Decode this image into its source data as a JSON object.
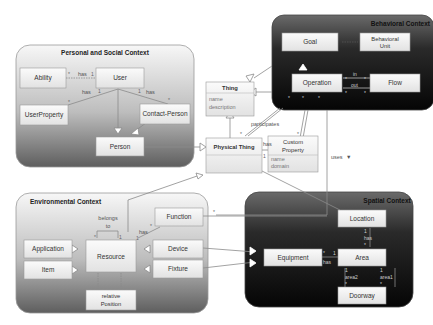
{
  "contexts": {
    "personal": {
      "title": "Personal and Social Context"
    },
    "behavioral": {
      "title": "Behavioral Context"
    },
    "environmental": {
      "title": "Environmental Context"
    },
    "spatial": {
      "title": "Spatial Context"
    }
  },
  "classes": {
    "ability": "Ability",
    "user": "User",
    "user_property": "UserProperty",
    "contact_person": "Contact-Person",
    "person": "Person",
    "thing": {
      "name": "Thing",
      "attrs": [
        "name",
        "description"
      ]
    },
    "physical_thing": "Physical Thing",
    "custom_property": {
      "name_line1": "Custom",
      "name_line2": "Property",
      "attrs": [
        "name",
        "domain"
      ]
    },
    "goal": "Goal",
    "behavioral_unit": {
      "line1": "Behavioral",
      "line2": "Unit"
    },
    "operation": "Operation",
    "flow": "Flow",
    "application": "Application",
    "item": "Item",
    "resource": "Resource",
    "function": "Function",
    "device": "Device",
    "fixture": "Fixture",
    "relative_position": {
      "line1": "relative",
      "line2": "Position"
    },
    "location": "Location",
    "equipment": "Equipment",
    "area": "Area",
    "doorway": "Doorway"
  },
  "relations": {
    "has": "has",
    "in": "in",
    "out": "out",
    "participates": "participates",
    "uses": "uses",
    "belongs_to_1": "belongs",
    "belongs_to_2": "to",
    "area1": "area1",
    "area2": "area2"
  },
  "multiplicity": {
    "one": "1",
    "many": "*"
  },
  "colors": {
    "context_light_top": "#f4f4f4",
    "context_light_bottom": "#6f6f6f",
    "context_dark": "#1a1a1a",
    "box_fill": "#efefef",
    "line": "#8a8a8a"
  }
}
